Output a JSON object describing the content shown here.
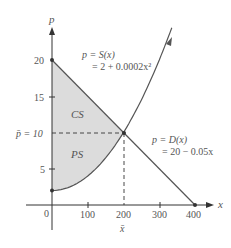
{
  "chart_data": {
    "type": "line",
    "title": "",
    "xlabel": "x",
    "ylabel": "p",
    "xlim": [
      0,
      400
    ],
    "ylim": [
      0,
      20
    ],
    "x_ticks": [
      "0",
      "100",
      "200",
      "300",
      "400"
    ],
    "y_ticks": [
      "5",
      "15",
      "20"
    ],
    "grid": false,
    "series": [
      {
        "name": "Supply",
        "label_line1": "p = S(x)",
        "label_line2": "= 2 + 0.0002x²",
        "equation": "2 + 0.0002x^2",
        "x": [
          0,
          100,
          200,
          300
        ],
        "values": [
          2,
          4,
          10,
          20
        ]
      },
      {
        "name": "Demand",
        "label_line1": "p = D(x)",
        "label_line2": "= 20 − 0.05x",
        "equation": "20 - 0.05x",
        "x": [
          0,
          100,
          200,
          300,
          400
        ],
        "values": [
          20,
          15,
          10,
          5,
          0
        ]
      }
    ],
    "equilibrium": {
      "x": 200,
      "p": 10,
      "x_label": "x̄",
      "p_label": "p̄ = 10"
    },
    "regions": [
      {
        "name": "CS",
        "label": "CS",
        "description": "Consumer surplus between demand curve and p̄ = 10"
      },
      {
        "name": "PS",
        "label": "PS",
        "description": "Producer surplus between p̄ = 10 and supply curve"
      }
    ],
    "colors": {
      "axis": "#333333",
      "curve": "#555555",
      "region_fill": "#dcdcdc"
    }
  }
}
